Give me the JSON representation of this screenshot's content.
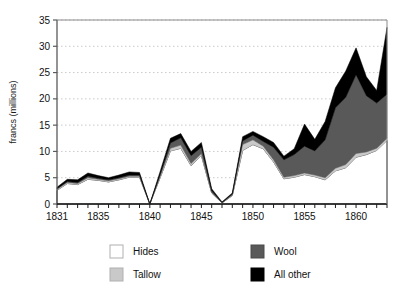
{
  "chart_data": {
    "type": "area",
    "stacked": true,
    "title": "",
    "xlabel": "",
    "ylabel": "francs (millions)",
    "xlim": [
      1831,
      1863
    ],
    "ylim": [
      0,
      35
    ],
    "yticks": [
      0,
      5,
      10,
      15,
      20,
      25,
      30,
      35
    ],
    "xticks": [
      1831,
      1835,
      1840,
      1845,
      1850,
      1855,
      1860
    ],
    "xtick_labels": [
      "1831",
      "1835",
      "1840",
      "1845",
      "1850",
      "1855",
      "1860"
    ],
    "ytick_labels": [
      "0",
      "5",
      "10",
      "15",
      "20",
      "25",
      "30",
      "35"
    ],
    "minor_xticks_every": 1,
    "grid": "horizontal-dotted",
    "legend_position": "below",
    "x": [
      1831,
      1832,
      1833,
      1834,
      1835,
      1836,
      1837,
      1838,
      1839,
      1840,
      1841,
      1842,
      1843,
      1844,
      1845,
      1846,
      1847,
      1848,
      1849,
      1850,
      1851,
      1852,
      1853,
      1854,
      1855,
      1856,
      1857,
      1858,
      1859,
      1860,
      1861,
      1862,
      1863
    ],
    "series": [
      {
        "name": "Hides",
        "color": "#ffffff",
        "values": [
          2.6,
          3.9,
          3.7,
          4.7,
          4.5,
          4.2,
          4.6,
          5.1,
          5.1,
          0.0,
          5.0,
          10.1,
          10.6,
          7.3,
          9.2,
          2.1,
          0.2,
          1.6,
          10.2,
          11.3,
          10.5,
          8.0,
          4.8,
          5.1,
          5.6,
          5.2,
          4.6,
          6.3,
          6.9,
          8.9,
          9.4,
          10.2,
          12.1
        ]
      },
      {
        "name": "Tallow",
        "color": "#c9c9c9",
        "values": [
          0.2,
          0.2,
          0.2,
          0.3,
          0.2,
          0.2,
          0.2,
          0.2,
          0.2,
          0.0,
          0.3,
          0.5,
          0.6,
          0.4,
          0.4,
          0.1,
          0.0,
          0.1,
          1.1,
          0.9,
          0.5,
          0.4,
          0.3,
          0.3,
          0.3,
          0.3,
          0.4,
          0.5,
          0.6,
          0.7,
          0.5,
          0.4,
          0.4
        ]
      },
      {
        "name": "Wool",
        "color": "#595959",
        "values": [
          0.1,
          0.2,
          0.2,
          0.3,
          0.2,
          0.2,
          0.2,
          0.2,
          0.2,
          0.0,
          0.3,
          1.0,
          1.4,
          1.5,
          1.2,
          0.3,
          0.1,
          0.2,
          0.7,
          0.9,
          0.9,
          2.4,
          3.3,
          4.0,
          5.1,
          4.6,
          7.2,
          11.5,
          12.8,
          15.0,
          10.7,
          8.6,
          8.4
        ]
      },
      {
        "name": "All other",
        "color": "#000000",
        "values": [
          0.3,
          0.4,
          0.5,
          0.6,
          0.5,
          0.4,
          0.5,
          0.6,
          0.5,
          0.0,
          0.6,
          0.9,
          0.8,
          0.8,
          0.9,
          0.4,
          0.1,
          0.2,
          0.8,
          0.7,
          0.9,
          0.9,
          0.7,
          1.1,
          4.2,
          2.2,
          3.5,
          3.8,
          5.0,
          5.1,
          3.6,
          2.4,
          12.7
        ]
      }
    ],
    "totals": [
      3.2,
      4.7,
      4.6,
      5.9,
      5.4,
      5.0,
      5.5,
      6.1,
      6.0,
      0.0,
      6.2,
      12.5,
      13.4,
      10.0,
      11.7,
      2.9,
      0.4,
      2.1,
      12.8,
      13.8,
      12.8,
      11.7,
      9.1,
      10.5,
      15.2,
      12.3,
      15.7,
      22.1,
      25.3,
      29.7,
      24.2,
      21.6,
      33.6
    ]
  },
  "legend": {
    "items": [
      {
        "label": "Hides",
        "color": "#ffffff"
      },
      {
        "label": "Tallow",
        "color": "#c9c9c9"
      },
      {
        "label": "Wool",
        "color": "#595959"
      },
      {
        "label": "All other",
        "color": "#000000"
      }
    ]
  }
}
